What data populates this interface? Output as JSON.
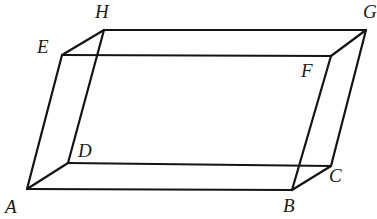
{
  "figure": {
    "kind": "parallelepiped-wireframe",
    "stroke_color": "#141414",
    "fill_color": "#ffffff",
    "background_color": "#ffffff",
    "stroke_width": 2.2,
    "thin_stroke_width": 1.8,
    "canvas": {
      "width": 375,
      "height": 219
    }
  },
  "vertices": [
    {
      "id": "A",
      "label": "A",
      "x": 27,
      "y": 189,
      "label_x": 5,
      "label_y": 197
    },
    {
      "id": "B",
      "label": "B",
      "x": 292,
      "y": 190,
      "label_x": 283,
      "label_y": 196
    },
    {
      "id": "C",
      "label": "C",
      "x": 331,
      "y": 166,
      "label_x": 329,
      "label_y": 166
    },
    {
      "id": "D",
      "label": "D",
      "x": 68,
      "y": 163,
      "label_x": 78,
      "label_y": 141
    },
    {
      "id": "E",
      "label": "E",
      "x": 62,
      "y": 55,
      "label_x": 37,
      "label_y": 37
    },
    {
      "id": "F",
      "label": "F",
      "x": 331,
      "y": 56,
      "label_x": 301,
      "label_y": 61
    },
    {
      "id": "G",
      "label": "G",
      "x": 366,
      "y": 30,
      "label_x": 363,
      "label_y": 2
    },
    {
      "id": "H",
      "label": "H",
      "x": 104,
      "y": 30,
      "label_x": 95,
      "label_y": 2
    }
  ],
  "edges": [
    {
      "id": "AB",
      "from": "A",
      "to": "B",
      "style": "solid"
    },
    {
      "id": "BC",
      "from": "B",
      "to": "C",
      "style": "solid"
    },
    {
      "id": "CD",
      "from": "C",
      "to": "D",
      "style": "solid"
    },
    {
      "id": "DA",
      "from": "D",
      "to": "A",
      "style": "solid"
    },
    {
      "id": "EF",
      "from": "E",
      "to": "F",
      "style": "solid"
    },
    {
      "id": "FG",
      "from": "F",
      "to": "G",
      "style": "solid"
    },
    {
      "id": "GH",
      "from": "G",
      "to": "H",
      "style": "solid"
    },
    {
      "id": "HE",
      "from": "H",
      "to": "E",
      "style": "solid"
    },
    {
      "id": "AE",
      "from": "A",
      "to": "E",
      "style": "solid"
    },
    {
      "id": "BF",
      "from": "B",
      "to": "F",
      "style": "solid"
    },
    {
      "id": "CG",
      "from": "C",
      "to": "G",
      "style": "solid"
    },
    {
      "id": "DH",
      "from": "D",
      "to": "H",
      "style": "solid"
    }
  ],
  "faces": [
    {
      "id": "bottom",
      "vertices": [
        "A",
        "B",
        "C",
        "D"
      ]
    },
    {
      "id": "top",
      "vertices": [
        "E",
        "F",
        "G",
        "H"
      ]
    },
    {
      "id": "front",
      "vertices": [
        "A",
        "B",
        "F",
        "E"
      ]
    },
    {
      "id": "back",
      "vertices": [
        "D",
        "C",
        "G",
        "H"
      ]
    },
    {
      "id": "left",
      "vertices": [
        "A",
        "D",
        "H",
        "E"
      ]
    },
    {
      "id": "right",
      "vertices": [
        "B",
        "C",
        "G",
        "F"
      ]
    }
  ]
}
